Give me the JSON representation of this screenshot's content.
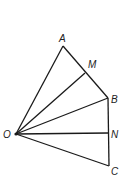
{
  "diagram": {
    "type": "geometry-figure",
    "points": {
      "O": {
        "label": "O",
        "x": 16,
        "y": 134
      },
      "A": {
        "label": "A",
        "x": 63,
        "y": 46
      },
      "M": {
        "label": "M",
        "x": 85,
        "y": 73
      },
      "B": {
        "label": "B",
        "x": 108,
        "y": 98
      },
      "N": {
        "label": "N",
        "x": 108,
        "y": 133
      },
      "C": {
        "label": "C",
        "x": 109,
        "y": 166
      }
    },
    "segments": [
      "OA",
      "OM",
      "OB",
      "ON",
      "OC",
      "AB",
      "BC"
    ],
    "colors": {
      "line": "#1a1a1a",
      "label": "#222222"
    }
  }
}
